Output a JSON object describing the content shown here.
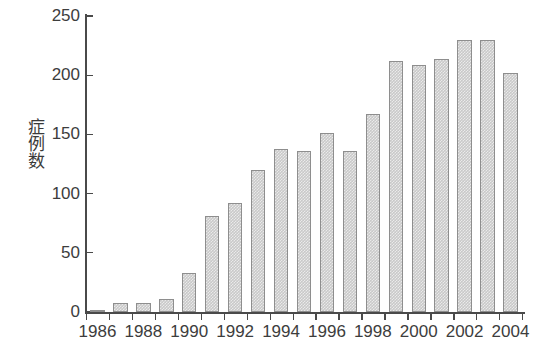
{
  "chart_data": {
    "type": "bar",
    "title": "",
    "subtitle": "",
    "xlabel": "",
    "ylabel": "症例数",
    "categories": [
      "1986",
      "1987",
      "1988",
      "1989",
      "1990",
      "1991",
      "1992",
      "1993",
      "1994",
      "1995",
      "1996",
      "1997",
      "1998",
      "1999",
      "2000",
      "2001",
      "2002",
      "2003",
      "2004"
    ],
    "values": [
      2,
      8,
      8,
      11,
      33,
      81,
      92,
      120,
      138,
      136,
      151,
      136,
      167,
      212,
      209,
      214,
      230,
      230,
      202
    ],
    "ylim": [
      0,
      250
    ],
    "yticks": [
      0,
      50,
      100,
      150,
      200,
      250
    ],
    "ytick_labels": [
      "0",
      "50",
      "100",
      "150",
      "200",
      "250"
    ],
    "xtick_labels_shown": [
      "1986",
      "1988",
      "1990",
      "1992",
      "1994",
      "1996",
      "1998",
      "2000",
      "2002",
      "2004"
    ],
    "grid": false,
    "legend": null,
    "legend_position": "none",
    "bar_fill_color": "#c9c9c9",
    "bar_edge_color": "#8e8e8e",
    "axis_color": "#4a4a4a",
    "text_color": "#3d3d3d",
    "background_color": "#ffffff"
  }
}
